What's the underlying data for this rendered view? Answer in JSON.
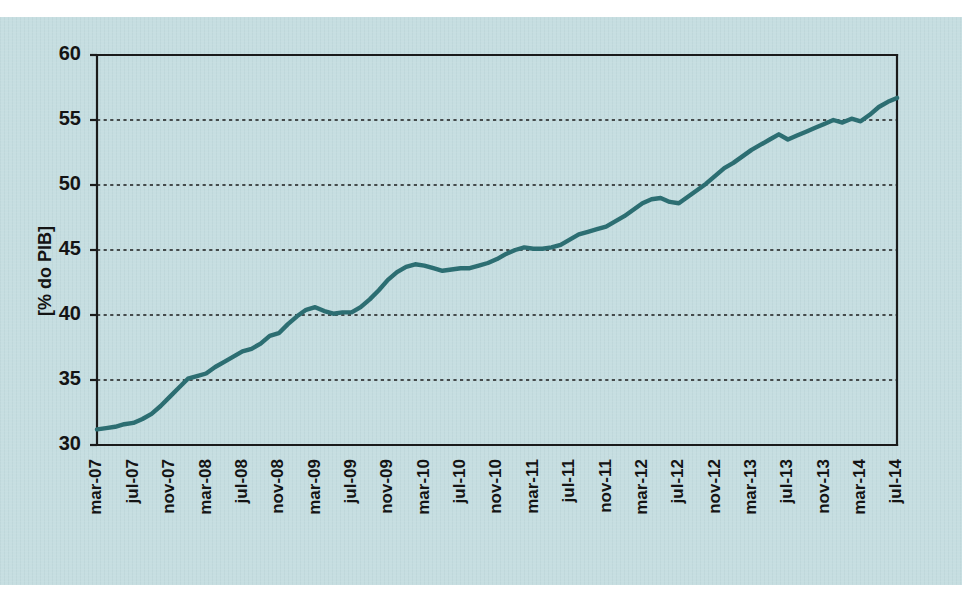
{
  "figure": {
    "background_color": "#c6dee1",
    "page_background_color": "#ffffff",
    "panel": {
      "x": 0,
      "y": 17,
      "width": 962,
      "height": 568
    }
  },
  "chart_data": {
    "type": "line",
    "title": "",
    "subtitle": "",
    "xlabel": "",
    "ylabel": "[% do PIB]",
    "ylim": [
      30,
      60
    ],
    "ytick_step": 5,
    "ytick_labels": [
      "30",
      "35",
      "40",
      "45",
      "50",
      "55",
      "60"
    ],
    "ytick_values": [
      30,
      35,
      40,
      45,
      50,
      55,
      60
    ],
    "grid": "horizontal-dotted",
    "grid_color": "#1b1b1b",
    "legend": "none",
    "legend_position": "none",
    "line_color": "#2c6e72",
    "line_width": 4.4,
    "series": [
      {
        "name": "",
        "x": [
          "mar-07",
          "abr-07",
          "mai-07",
          "jun-07",
          "jul-07",
          "ago-07",
          "set-07",
          "out-07",
          "nov-07",
          "dez-07",
          "jan-08",
          "fev-08",
          "mar-08",
          "abr-08",
          "mai-08",
          "jun-08",
          "jul-08",
          "ago-08",
          "set-08",
          "out-08",
          "nov-08",
          "dez-08",
          "jan-09",
          "fev-09",
          "mar-09",
          "abr-09",
          "mai-09",
          "jun-09",
          "jul-09",
          "ago-09",
          "set-09",
          "out-09",
          "nov-09",
          "dez-09",
          "jan-10",
          "fev-10",
          "mar-10",
          "abr-10",
          "mai-10",
          "jun-10",
          "jul-10",
          "ago-10",
          "set-10",
          "out-10",
          "nov-10",
          "dez-10",
          "jan-11",
          "fev-11",
          "mar-11",
          "abr-11",
          "mai-11",
          "jun-11",
          "jul-11",
          "ago-11",
          "set-11",
          "out-11",
          "nov-11",
          "dez-11",
          "jan-12",
          "fev-12",
          "mar-12",
          "abr-12",
          "mai-12",
          "jun-12",
          "jul-12",
          "ago-12",
          "set-12",
          "out-12",
          "nov-12",
          "dez-12",
          "jan-13",
          "fev-13",
          "mar-13",
          "abr-13",
          "mai-13",
          "jun-13",
          "jul-13",
          "ago-13",
          "set-13",
          "out-13",
          "nov-13",
          "dez-13",
          "jan-14",
          "fev-14",
          "mar-14",
          "abr-14",
          "mai-14",
          "jun-14",
          "jul-14"
        ],
        "y": [
          31.2,
          31.3,
          31.4,
          31.6,
          31.7,
          32.0,
          32.4,
          33.0,
          33.7,
          34.4,
          35.1,
          35.3,
          35.5,
          36.0,
          36.4,
          36.8,
          37.2,
          37.4,
          37.8,
          38.4,
          38.6,
          39.3,
          39.9,
          40.4,
          40.6,
          40.3,
          40.1,
          40.2,
          40.2,
          40.6,
          41.2,
          41.9,
          42.7,
          43.3,
          43.7,
          43.9,
          43.8,
          43.6,
          43.4,
          43.5,
          43.6,
          43.6,
          43.8,
          44.0,
          44.3,
          44.7,
          45.0,
          45.2,
          45.1,
          45.1,
          45.2,
          45.4,
          45.8,
          46.2,
          46.4,
          46.6,
          46.8,
          47.2,
          47.6,
          48.1,
          48.6,
          48.9,
          49.0,
          48.7,
          48.6,
          49.1,
          49.6,
          50.1,
          50.7,
          51.3,
          51.7,
          52.2,
          52.7,
          53.1,
          53.5,
          53.9,
          53.5,
          53.8,
          54.1,
          54.4,
          54.7,
          55.0,
          54.8,
          55.1,
          54.9,
          55.4,
          56.0,
          56.4,
          56.7
        ]
      }
    ],
    "xtick_labels": [
      "mar-07",
      "jul-07",
      "nov-07",
      "mar-08",
      "jul-08",
      "nov-08",
      "mar-09",
      "jul-09",
      "nov-09",
      "mar-10",
      "jul-10",
      "nov-10",
      "mar-11",
      "jul-11",
      "nov-11",
      "mar-12",
      "jul-12",
      "nov-12",
      "mar-13",
      "jul-13",
      "nov-13",
      "mar-14",
      "jul-14"
    ],
    "xtick_indices": [
      0,
      4,
      8,
      12,
      16,
      20,
      24,
      28,
      32,
      36,
      40,
      44,
      48,
      52,
      56,
      60,
      64,
      68,
      72,
      76,
      80,
      84,
      88
    ],
    "xtick_rotation": 90
  }
}
